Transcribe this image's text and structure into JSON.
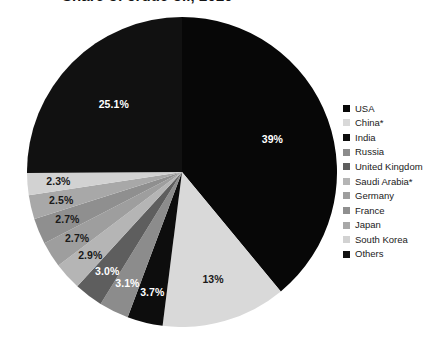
{
  "chart_data": {
    "type": "pie",
    "title": "Share of crude oil, 2020",
    "categories": [
      "USA",
      "China*",
      "India",
      "Russia",
      "United Kingdom",
      "Saudi Arabia*",
      "Germany",
      "France",
      "Japan",
      "South Korea",
      "Others"
    ],
    "values": [
      39,
      13,
      3.7,
      3.1,
      3.0,
      2.9,
      2.7,
      2.7,
      2.5,
      2.3,
      25.1
    ],
    "value_labels": [
      "39%",
      "13%",
      "3.7%",
      "3.1%",
      "3.0%",
      "2.9%",
      "2.7%",
      "2.7%",
      "2.5%",
      "2.3%",
      "25.1%"
    ],
    "colors": [
      "#070707",
      "#d9d9d9",
      "#0d0d0d",
      "#8c8c8c",
      "#5e5e5e",
      "#b5b5b5",
      "#9e9e9e",
      "#8f8f8f",
      "#a8a8a8",
      "#d2d2d2",
      "#111111"
    ],
    "label_on_dark": [
      true,
      false,
      true,
      true,
      true,
      false,
      false,
      false,
      false,
      false,
      true
    ],
    "legend_position": "right",
    "start_angle_deg": 0,
    "xlabel": "",
    "ylabel": ""
  },
  "legend": {
    "items": [
      {
        "label": "USA"
      },
      {
        "label": "China*"
      },
      {
        "label": "India"
      },
      {
        "label": "Russia"
      },
      {
        "label": "United Kingdom"
      },
      {
        "label": "Saudi Arabia*"
      },
      {
        "label": "Germany"
      },
      {
        "label": "France"
      },
      {
        "label": "Japan"
      },
      {
        "label": "South Korea"
      },
      {
        "label": "Others"
      }
    ]
  }
}
